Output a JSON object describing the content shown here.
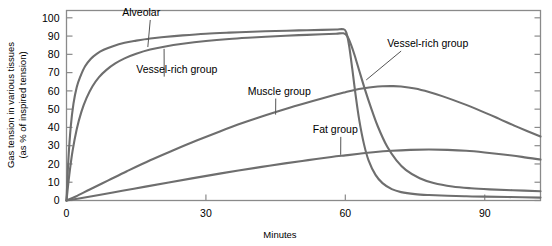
{
  "chart_data": {
    "type": "line",
    "title": "",
    "xlabel": "Minutes",
    "ylabel": "Gas tension in various tissues (as % of inspired tension)",
    "xlim": [
      0,
      102
    ],
    "ylim": [
      0,
      104
    ],
    "xticks": [
      0,
      30,
      60,
      90
    ],
    "yticks": [
      0,
      10,
      20,
      30,
      40,
      50,
      60,
      70,
      80,
      90,
      100
    ],
    "grid": false,
    "legend_position": "inline-annotations",
    "line_color": "#6e6e6e",
    "frame_color": "#8a8a8a",
    "annotations": [
      {
        "text": "Alveolar",
        "x": 12,
        "y": 101,
        "points_to_x": 17.5,
        "points_to_y": 84
      },
      {
        "text": "Vessel-rich group",
        "x": 15,
        "y": 70,
        "points_to_x": 21,
        "points_to_y": 83
      },
      {
        "text": "Muscle group",
        "x": 39,
        "y": 58,
        "points_to_x": 45,
        "points_to_y": 47
      },
      {
        "text": "Fat group",
        "x": 53,
        "y": 37,
        "points_to_x": 59,
        "points_to_y": 25
      },
      {
        "text": "Vessel-rich group",
        "x": 69,
        "y": 84,
        "points_to_x": 64.5,
        "points_to_y": 66
      }
    ],
    "series": [
      {
        "name": "Alveolar",
        "x": [
          0,
          0.4,
          0.9,
          1.5,
          2.2,
          3,
          4,
          5.2,
          6.5,
          8,
          10,
          12.5,
          15,
          18,
          21,
          25,
          30,
          35,
          40,
          45,
          50,
          55,
          58,
          59.6,
          60.2,
          60.8,
          61.5,
          62.2,
          63,
          64,
          65,
          66.5,
          68,
          70,
          72,
          75,
          78,
          82,
          86,
          90,
          95,
          102
        ],
        "y": [
          0,
          22,
          40,
          53,
          62,
          68,
          73.5,
          77.5,
          80.3,
          82.5,
          84.5,
          86.3,
          87.5,
          88.7,
          89.5,
          90.4,
          91.3,
          91.9,
          92.4,
          92.8,
          93.1,
          93.4,
          93.6,
          93.7,
          92,
          85,
          72,
          58,
          44,
          31,
          22,
          14,
          9.5,
          6.2,
          4.6,
          3.5,
          3,
          2.6,
          2.3,
          2.1,
          1.9,
          1.6
        ]
      },
      {
        "name": "Vessel-rich group",
        "x": [
          0,
          0.6,
          1.3,
          2.2,
          3.2,
          4.3,
          5.6,
          7,
          8.6,
          10.5,
          12.5,
          15,
          18,
          21,
          25,
          30,
          35,
          40,
          45,
          50,
          55,
          58,
          59.6,
          60.4,
          61.2,
          62,
          63,
          64.2,
          65.5,
          67,
          69,
          71,
          73,
          76,
          79,
          83,
          87,
          91,
          96,
          102
        ],
        "y": [
          0,
          14,
          27,
          39,
          48.5,
          56,
          62.5,
          67.5,
          71.5,
          75,
          77.8,
          80.3,
          82.6,
          84.2,
          85.8,
          87.3,
          88.4,
          89.2,
          89.9,
          90.5,
          91,
          91.3,
          91.5,
          90,
          85.5,
          79.5,
          71,
          61,
          51,
          40.5,
          29.5,
          22,
          16.8,
          12.2,
          9.6,
          7.7,
          6.7,
          6.1,
          5.6,
          5.1
        ]
      },
      {
        "name": "Muscle group",
        "x": [
          0,
          2,
          5,
          9,
          13,
          18,
          23,
          28,
          33,
          38,
          43,
          48,
          53,
          58,
          60,
          62,
          64,
          66,
          68,
          70,
          72,
          75,
          78,
          81,
          85,
          89,
          93,
          97,
          102
        ],
        "y": [
          0,
          2.2,
          6,
          11,
          16,
          22,
          27.5,
          32.8,
          37.8,
          42.5,
          46.8,
          50.8,
          54.5,
          58,
          59.3,
          60.5,
          61.4,
          62.1,
          62.5,
          62.6,
          62.4,
          61.3,
          59.4,
          57,
          53.3,
          49.2,
          44.8,
          40.3,
          35
        ]
      },
      {
        "name": "Fat group",
        "x": [
          0,
          3,
          7,
          12,
          17,
          22,
          27,
          32,
          37,
          42,
          47,
          52,
          57,
          60,
          63,
          66,
          70,
          74,
          78,
          82,
          86,
          90,
          94,
          98,
          102
        ],
        "y": [
          0,
          1.2,
          3,
          5.3,
          7.6,
          9.9,
          12.1,
          14.3,
          16.4,
          18.4,
          20.3,
          22.1,
          23.8,
          24.7,
          25.6,
          26.4,
          27.2,
          27.7,
          27.9,
          27.7,
          27.2,
          26.3,
          25.2,
          23.9,
          22.4
        ]
      }
    ]
  },
  "axes": {
    "x_label": "Minutes",
    "y_label_line1": "Gas tension in various tissues",
    "y_label_line2": "(as % of inspired tension)",
    "x_tick_labels": [
      "0",
      "30",
      "60",
      "90"
    ],
    "y_tick_labels": [
      "0",
      "10",
      "20",
      "30",
      "40",
      "50",
      "60",
      "70",
      "80",
      "90",
      "100"
    ]
  },
  "labels": {
    "alveolar": "Alveolar",
    "vessel_rich_left": "Vessel-rich group",
    "vessel_rich_right": "Vessel-rich group",
    "muscle": "Muscle group",
    "fat": "Fat group"
  }
}
